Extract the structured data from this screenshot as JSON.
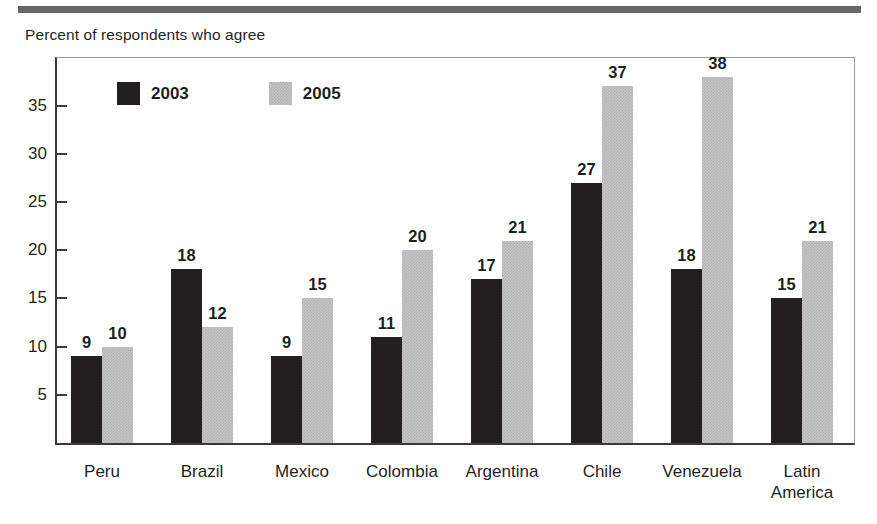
{
  "figure": {
    "title": "Percent of respondents who agree"
  },
  "legend": {
    "items": [
      {
        "label": "2003",
        "key": "y2003",
        "color": "#231f20"
      },
      {
        "label": "2005",
        "key": "y2005",
        "color": "#c4c4c4"
      }
    ]
  },
  "axis": {
    "y_ticks": [
      "5",
      "10",
      "15",
      "20",
      "25",
      "30",
      "35"
    ],
    "y_tick_values": [
      5,
      10,
      15,
      20,
      25,
      30,
      35
    ]
  },
  "chart_data": {
    "type": "bar",
    "title": "Percent of respondents who agree",
    "xlabel": "",
    "ylabel": "Percent of respondents who agree",
    "ylim": [
      0,
      40
    ],
    "grid": false,
    "legend_position": "top-left inside plot",
    "categories": [
      "Peru",
      "Brazil",
      "Mexico",
      "Colombia",
      "Argentina",
      "Chile",
      "Venezuela",
      "Latin\nAmerica"
    ],
    "series": [
      {
        "name": "2003",
        "color": "#231f20",
        "values": [
          9,
          18,
          9,
          11,
          17,
          27,
          18,
          15
        ]
      },
      {
        "name": "2005",
        "color": "#c4c4c4",
        "values": [
          10,
          12,
          15,
          20,
          21,
          37,
          38,
          21
        ]
      }
    ],
    "data_labels": [
      [
        "9",
        "10"
      ],
      [
        "18",
        "12"
      ],
      [
        "9",
        "15"
      ],
      [
        "11",
        "20"
      ],
      [
        "17",
        "21"
      ],
      [
        "27",
        "37"
      ],
      [
        "18",
        "38"
      ],
      [
        "15",
        "21"
      ]
    ]
  }
}
